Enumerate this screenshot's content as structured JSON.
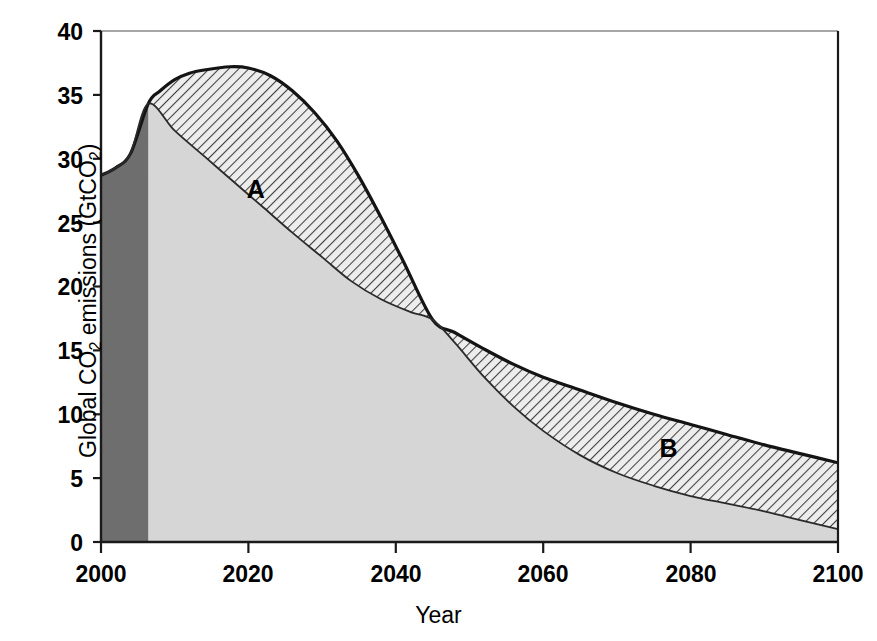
{
  "chart_data": {
    "type": "area",
    "title": "",
    "xlabel": "Year",
    "ylabel_parts": {
      "pre": "Global CO",
      "sub1": "2",
      "mid": " emissions (GtCO",
      "sub2": "2",
      "post": ")"
    },
    "ylabel": "Global CO2 emissions (GtCO2)",
    "xlim": [
      2000,
      2100
    ],
    "ylim": [
      0,
      40
    ],
    "xticks": [
      2000,
      2020,
      2040,
      2060,
      2080,
      2100
    ],
    "xtick_labels": [
      "2000",
      "2020",
      "2040",
      "2060",
      "2080",
      "2100"
    ],
    "yticks": [
      0,
      5,
      10,
      15,
      20,
      25,
      30,
      35,
      40
    ],
    "ytick_labels": [
      "0",
      "5",
      "10",
      "15",
      "20",
      "25",
      "30",
      "35",
      "40"
    ],
    "grid": false,
    "legend_position": "inline-annotations",
    "annotations": [
      {
        "text": "A",
        "x": 2021,
        "y": 27.5
      },
      {
        "text": "B",
        "x": 2077,
        "y": 7.2
      }
    ],
    "colors": {
      "historical_fill": "#6e6e6e",
      "lower_fill": "#d4d4d4",
      "hatch_fill": "#e8e8e8",
      "hatch_line": "#4a4a4a",
      "curve_line": "#1a1a1a",
      "axis": "#1a1a1a",
      "background": "#ffffff"
    },
    "historical_period": [
      2000,
      2006.4
    ],
    "series": [
      {
        "name": "A",
        "description": "Upper curve (baseline / reference emissions pathway)",
        "x": [
          2000,
          2002,
          2004,
          2006.4,
          2008,
          2010,
          2012,
          2014,
          2017.5,
          2020,
          2023,
          2026,
          2029,
          2032,
          2035,
          2038,
          2041,
          2045,
          2048,
          2052,
          2056,
          2060,
          2065,
          2070,
          2075,
          2080,
          2085,
          2090,
          2095,
          2100
        ],
        "values": [
          28.7,
          29.3,
          30.4,
          34.3,
          35.3,
          36.2,
          36.7,
          36.95,
          37.2,
          37.1,
          36.5,
          35.3,
          33.6,
          31.4,
          28.6,
          25.4,
          22.0,
          17.4,
          16.4,
          15.1,
          13.9,
          12.9,
          11.9,
          10.9,
          10.0,
          9.2,
          8.4,
          7.6,
          6.9,
          6.2
        ]
      },
      {
        "name": "B",
        "description": "Lower curve (mitigation pathway)",
        "x": [
          2000,
          2002,
          2004,
          2006.4,
          2010,
          2014,
          2018,
          2022,
          2026,
          2030,
          2034,
          2038,
          2042,
          2045,
          2048,
          2052,
          2056,
          2060,
          2065,
          2070,
          2075,
          2080,
          2085,
          2090,
          2095,
          2100
        ],
        "values": [
          28.7,
          29.3,
          30.4,
          34.3,
          32.2,
          30.2,
          28.2,
          26.2,
          24.2,
          22.3,
          20.4,
          19.0,
          18.0,
          17.4,
          15.6,
          12.9,
          10.6,
          8.7,
          6.8,
          5.4,
          4.4,
          3.6,
          3.0,
          2.4,
          1.7,
          1.0
        ]
      }
    ]
  },
  "axis": {
    "x_title": "Year",
    "y_title": "Global CO2 emissions (GtCO2)"
  }
}
